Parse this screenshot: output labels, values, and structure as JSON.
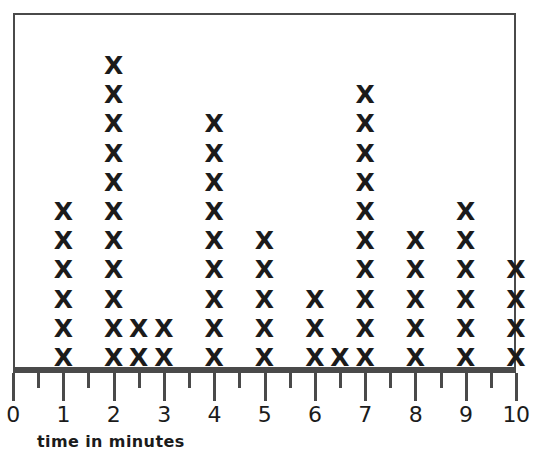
{
  "chart_data": {
    "type": "scatter",
    "plot_style": "dot-plot-x-marks",
    "title": "",
    "subtitle": "",
    "xlabel": "time in minutes",
    "ylabel": "",
    "xlim": [
      0,
      10
    ],
    "ylim": [
      0,
      12
    ],
    "grid": false,
    "legend": null,
    "mark_glyph": "X",
    "mark_color": "#1b1b1b",
    "frame_color": "#4a4a4a",
    "axis_color": "#4a4a4a",
    "background": "#ffffff",
    "x_major_ticks": [
      0,
      1,
      2,
      3,
      4,
      5,
      6,
      7,
      8,
      9,
      10
    ],
    "x_minor_ticks": [
      0.5,
      1.5,
      2.5,
      3.5,
      4.5,
      5.5,
      6.5,
      7.5,
      8.5,
      9.5
    ],
    "x_tick_labels": [
      "0",
      "1",
      "2",
      "3",
      "4",
      "5",
      "6",
      "7",
      "8",
      "9",
      "10"
    ],
    "categories": [
      1,
      2,
      2.5,
      3,
      4,
      5,
      6,
      6.5,
      7,
      8,
      9,
      10
    ],
    "values": [
      6,
      11,
      2,
      2,
      9,
      5,
      3,
      1,
      10,
      5,
      6,
      4
    ],
    "points": [
      {
        "x": 1,
        "count": 6
      },
      {
        "x": 2,
        "count": 11
      },
      {
        "x": 2.5,
        "count": 2
      },
      {
        "x": 3,
        "count": 2
      },
      {
        "x": 4,
        "count": 9
      },
      {
        "x": 5,
        "count": 5
      },
      {
        "x": 6,
        "count": 3
      },
      {
        "x": 6.5,
        "count": 1
      },
      {
        "x": 7,
        "count": 10
      },
      {
        "x": 8,
        "count": 5
      },
      {
        "x": 9,
        "count": 6
      },
      {
        "x": 10,
        "count": 4
      }
    ],
    "total_marks": 64
  }
}
